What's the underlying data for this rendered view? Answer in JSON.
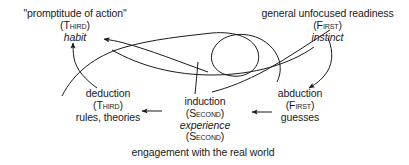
{
  "diagram": {
    "background_color": "#ffffff",
    "stroke_color": "#1a1a1a",
    "nodes": {
      "habit": {
        "quote": "\"promptitude of action\"",
        "category": "(Third)",
        "term": "habit"
      },
      "instinct": {
        "description": "general unfocused readiness",
        "category": "(First)",
        "term": "instinct"
      },
      "deduction": {
        "name": "deduction",
        "category": "(Third)",
        "result": "rules, theories"
      },
      "induction": {
        "name": "induction",
        "category": "(Second)",
        "term": "experience",
        "category2": "(Second)"
      },
      "abduction": {
        "name": "abduction",
        "category": "(First)",
        "result": "guesses"
      },
      "engagement": {
        "text": "engagement with the real world"
      }
    }
  }
}
